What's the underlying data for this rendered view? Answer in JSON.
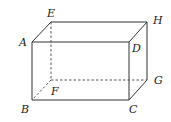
{
  "diagram": {
    "type": "rectangular-prism",
    "vertices": {
      "A": {
        "label": "A",
        "x": 32,
        "y": 42
      },
      "B": {
        "label": "B",
        "x": 32,
        "y": 100
      },
      "C": {
        "label": "C",
        "x": 129,
        "y": 100
      },
      "D": {
        "label": "D",
        "x": 129,
        "y": 42
      },
      "E": {
        "label": "E",
        "x": 51,
        "y": 22
      },
      "F": {
        "label": "F",
        "x": 51,
        "y": 80
      },
      "G": {
        "label": "G",
        "x": 147,
        "y": 80
      },
      "H": {
        "label": "H",
        "x": 147,
        "y": 22
      }
    },
    "visible_edges": [
      "AB",
      "BC",
      "CD",
      "DA",
      "AE",
      "EH",
      "HD",
      "HG",
      "GC"
    ],
    "hidden_edges": [
      "EF",
      "FG",
      "FB"
    ]
  }
}
